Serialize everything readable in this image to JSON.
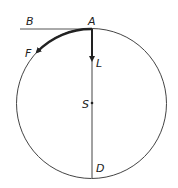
{
  "diagram": {
    "title": "",
    "labels": {
      "A": "A",
      "B": "B",
      "F": "F",
      "L": "L",
      "S": "S",
      "D": "D"
    },
    "geometry": {
      "circle": {
        "cx": 91.5,
        "cy": 103.5,
        "r": 75
      },
      "tangent_line": {
        "x1": 20,
        "y1": 29,
        "x2": 92,
        "y2": 29
      },
      "vertical_line": {
        "x1": 92,
        "y1": 29,
        "x2": 92,
        "y2": 178
      },
      "arrow_L_end_y": 62,
      "center_point_y": 103
    },
    "colors": {
      "stroke": "#444444",
      "arrow": "#222222",
      "background": "#ffffff"
    }
  }
}
